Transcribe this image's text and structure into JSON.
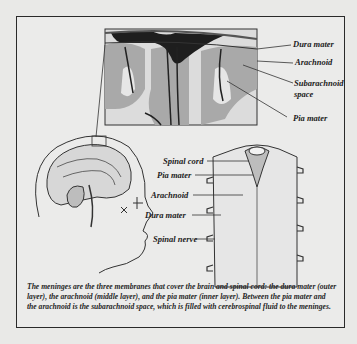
{
  "figure": {
    "inset_labels": {
      "dura_mater": "Dura mater",
      "arachnoid": "Arachnoid",
      "subarachnoid_space_line1": "Subarachnoid",
      "subarachnoid_space_line2": "space",
      "pia_mater": "Pia mater"
    },
    "spinal_labels": {
      "spinal_cord": "Spinal cord",
      "pia_mater": "Pia mater",
      "arachnoid": "Arachnoid",
      "dura_mater": "Dura mater",
      "spinal_nerve": "Spinal nerve"
    },
    "caption": "The meninges are the three membranes that cover the brain and spinal cord: the dura mater (outer layer), the arachnoid (middle layer), and the pia mater (inner layer). Between the pia mater and the arachnoid is the subarachnoid space, which is filled with cerebrospinal fluid to the meninges."
  }
}
